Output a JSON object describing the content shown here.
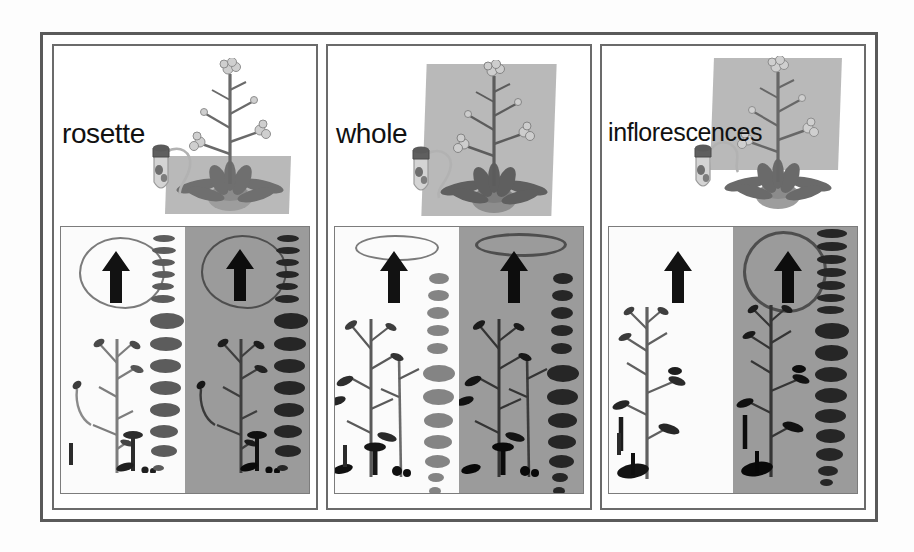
{
  "figure": {
    "panel_count": 3,
    "frame_color": "#5a5a5a",
    "background_color": "#ffffff"
  },
  "panels": [
    {
      "id": "panel-rosette",
      "label": "rosette",
      "highlight_region": "rosette leaves",
      "highlight_color": "#a9a9a9",
      "top_illustration": {
        "plant_name": "arabidopsis-plant",
        "tube_name": "centrifuge-tube",
        "connector_name": "sampling-tube-connector"
      },
      "bottom_photo": {
        "left_half": {
          "background": "#fbfbfb",
          "tone": "white",
          "arrow": "up-arrow",
          "pencil_blob": true,
          "pod_column": true,
          "pod_count": 14,
          "scale_bar": true,
          "plant_skeleton": true
        },
        "right_half": {
          "background": "#9b9b9b",
          "tone": "gray",
          "arrow": "up-arrow",
          "pencil_blob": true,
          "pod_column": true,
          "pod_count": 14,
          "scale_bar": false,
          "plant_skeleton": true
        }
      }
    },
    {
      "id": "panel-whole",
      "label": "whole",
      "highlight_region": "whole plant",
      "highlight_color": "#a9a9a9",
      "top_illustration": {
        "plant_name": "arabidopsis-plant",
        "tube_name": "centrifuge-tube",
        "connector_name": "sampling-tube-connector"
      },
      "bottom_photo": {
        "left_half": {
          "background": "#fbfbfb",
          "tone": "white",
          "arrow": "up-arrow",
          "pencil_blob": true,
          "pod_column": true,
          "pod_count": 13,
          "scale_bar": true,
          "plant_skeleton": true
        },
        "right_half": {
          "background": "#9b9b9b",
          "tone": "gray",
          "arrow": "up-arrow",
          "pencil_blob": true,
          "pod_column": true,
          "pod_count": 13,
          "scale_bar": false,
          "plant_skeleton": true
        }
      }
    },
    {
      "id": "panel-inflorescences",
      "label": "inflorescences",
      "highlight_region": "inflorescence stalk",
      "highlight_color": "#a9a9a9",
      "top_illustration": {
        "plant_name": "arabidopsis-plant",
        "tube_name": "centrifuge-tube",
        "connector_name": "sampling-tube-connector"
      },
      "bottom_photo": {
        "left_half": {
          "background": "#fbfbfb",
          "tone": "white",
          "arrow": "up-arrow",
          "pencil_blob": false,
          "pod_column": false,
          "pod_count": 0,
          "scale_bar": true,
          "plant_skeleton": true
        },
        "right_half": {
          "background": "#9b9b9b",
          "tone": "gray",
          "arrow": "up-arrow",
          "pencil_blob": true,
          "pod_column": true,
          "pod_count": 16,
          "scale_bar": false,
          "plant_skeleton": true
        }
      }
    }
  ]
}
